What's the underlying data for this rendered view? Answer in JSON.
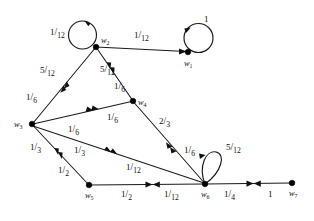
{
  "figure": {
    "type": "weighted-directed-graph",
    "background_color": "#ffffff",
    "ink_color": "#111111",
    "nodes": [
      {
        "id": "w1",
        "label": "w",
        "subscript": "1",
        "x": 188,
        "y": 52,
        "label_dx": -4,
        "label_dy": 14
      },
      {
        "id": "w2",
        "label": "w",
        "subscript": "2",
        "x": 96,
        "y": 47,
        "label_dx": 5,
        "label_dy": -4
      },
      {
        "id": "w3",
        "label": "w",
        "subscript": "3",
        "x": 32,
        "y": 124,
        "label_dx": -18,
        "label_dy": 3
      },
      {
        "id": "w4",
        "label": "w",
        "subscript": "4",
        "x": 133,
        "y": 101,
        "label_dx": 5,
        "label_dy": 4
      },
      {
        "id": "w5",
        "label": "w",
        "subscript": "5",
        "x": 89,
        "y": 185,
        "label_dx": -4,
        "label_dy": 13
      },
      {
        "id": "w6",
        "label": "w",
        "subscript": "6",
        "x": 205,
        "y": 184,
        "label_dx": -4,
        "label_dy": 13
      },
      {
        "id": "w7",
        "label": "w",
        "subscript": "7",
        "x": 292,
        "y": 183,
        "label_dx": -3,
        "label_dy": 13
      }
    ],
    "self_loops": [
      {
        "id": "loop-w1",
        "node": "w1",
        "weight_numerator": "1",
        "weight_denominator": "",
        "weight_text": "1",
        "label_x": 204,
        "label_y": 22
      },
      {
        "id": "loop-w2",
        "node": "w2",
        "weight_numerator": "1",
        "weight_denominator": "12",
        "weight_text": "1/12",
        "label_x": 50,
        "label_y": 35
      },
      {
        "id": "loop-w6",
        "node": "w6",
        "weight_numerator": "5",
        "weight_denominator": "12",
        "weight_text": "5/12",
        "label_x": 226,
        "label_y": 150
      }
    ],
    "edges": [
      {
        "id": "e-w2-w1",
        "from": "w2",
        "to": "w1",
        "weights": [
          {
            "numerator": "1",
            "denominator": "12",
            "text": "1/12",
            "label_x": 134,
            "label_y": 38
          }
        ]
      },
      {
        "id": "e-w2-w3",
        "from": "w2",
        "to": "w3",
        "weights": [
          {
            "numerator": "5",
            "denominator": "12",
            "text": "5/12",
            "label_x": 46,
            "label_y": 73
          },
          {
            "numerator": "1",
            "denominator": "6",
            "text": "1/6",
            "label_x": 31,
            "label_y": 100
          }
        ]
      },
      {
        "id": "e-w2-w4",
        "from": "w2",
        "to": "w4",
        "weights": [
          {
            "numerator": "5",
            "denominator": "12",
            "text": "5/12",
            "label_x": 104,
            "label_y": 72
          },
          {
            "numerator": "1",
            "denominator": "6",
            "text": "1/6",
            "label_x": 117,
            "label_y": 89
          }
        ]
      },
      {
        "id": "e-w3-w4",
        "from": "w3",
        "to": "w4",
        "weights": [
          {
            "numerator": "1",
            "denominator": "6",
            "text": "1/6",
            "label_x": 72,
            "label_y": 131
          },
          {
            "numerator": "1",
            "denominator": "6",
            "text": "1/6",
            "label_x": 111,
            "label_y": 119
          }
        ]
      },
      {
        "id": "e-w4-w6",
        "from": "w4",
        "to": "w6",
        "weights": [
          {
            "numerator": "2",
            "denominator": "3",
            "text": "2/3",
            "label_x": 163,
            "label_y": 124
          },
          {
            "numerator": "1",
            "denominator": "6",
            "text": "1/6",
            "label_x": 188,
            "label_y": 152
          }
        ]
      },
      {
        "id": "e-w3-w5",
        "from": "w3",
        "to": "w5",
        "weights": [
          {
            "numerator": "1",
            "denominator": "3",
            "text": "1/3",
            "label_x": 35,
            "label_y": 149
          },
          {
            "numerator": "1",
            "denominator": "2",
            "text": "1/2",
            "label_x": 64,
            "label_y": 172
          }
        ]
      },
      {
        "id": "e-w3-w6",
        "from": "w3",
        "to": "w6",
        "weights": [
          {
            "numerator": "1",
            "denominator": "3",
            "text": "1/3",
            "label_x": 78,
            "label_y": 152
          },
          {
            "numerator": "1",
            "denominator": "12",
            "text": "1/12",
            "label_x": 132,
            "label_y": 169
          }
        ]
      },
      {
        "id": "e-w5-w6",
        "from": "w5",
        "to": "w6",
        "weights": [
          {
            "numerator": "1",
            "denominator": "2",
            "text": "1/2",
            "label_x": 126,
            "label_y": 196
          },
          {
            "numerator": "1",
            "denominator": "12",
            "text": "1/12",
            "label_x": 170,
            "label_y": 196
          }
        ]
      },
      {
        "id": "e-w6-w7",
        "from": "w6",
        "to": "w7",
        "weights": [
          {
            "numerator": "1",
            "denominator": "4",
            "text": "1/4",
            "label_x": 228,
            "label_y": 196
          },
          {
            "numerator": "1",
            "denominator": "",
            "text": "1",
            "label_x": 268,
            "label_y": 196
          }
        ]
      }
    ]
  }
}
